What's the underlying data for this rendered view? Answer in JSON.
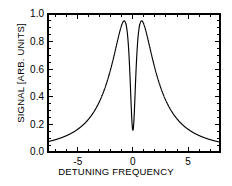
{
  "chart_data": {
    "type": "line",
    "title": "",
    "xlabel": "DETUNING FREQUENCY",
    "ylabel": "SIGNAL [ARB. UNITS]",
    "xlim": [
      -7.7,
      7.9
    ],
    "ylim": [
      0.0,
      1.0
    ],
    "grid": false,
    "legend": null,
    "x_ticks_major": [
      -5,
      0,
      5
    ],
    "x_tick_labels": [
      "-5",
      "0",
      "5"
    ],
    "x_tick_minor_step": 1,
    "y_ticks_major": [
      0.0,
      0.2,
      0.4,
      0.6,
      0.8,
      1.0
    ],
    "y_tick_labels": [
      "0.0",
      "0.2",
      "0.4",
      "0.6",
      "0.8",
      "1.0"
    ],
    "y_tick_minor_step": 0.05,
    "line_color": "#000000",
    "frame_color": "#000000",
    "peaks": [
      {
        "x": -0.55,
        "y": 0.95
      },
      {
        "x": 0.55,
        "y": 0.95
      }
    ],
    "dip": {
      "x": 0.0,
      "y": 0.12
    },
    "broad_lorentzian_hwhm": 1.9,
    "narrow_dip_hwhm": 0.36,
    "x": [
      -7.7,
      -7.4,
      -7.1,
      -6.8,
      -6.5,
      -6.2,
      -5.9,
      -5.6,
      -5.3,
      -5.0,
      -4.7,
      -4.4,
      -4.1,
      -3.8,
      -3.5,
      -3.2,
      -2.9,
      -2.6,
      -2.3,
      -2.0,
      -1.8,
      -1.6,
      -1.4,
      -1.2,
      -1.0,
      -0.9,
      -0.8,
      -0.7,
      -0.6,
      -0.55,
      -0.5,
      -0.4,
      -0.3,
      -0.2,
      -0.1,
      0.0,
      0.1,
      0.2,
      0.3,
      0.4,
      0.5,
      0.55,
      0.6,
      0.7,
      0.8,
      0.9,
      1.0,
      1.2,
      1.4,
      1.6,
      1.8,
      2.0,
      2.3,
      2.6,
      2.9,
      3.2,
      3.5,
      3.8,
      4.1,
      4.4,
      4.7,
      5.0,
      5.3,
      5.6,
      5.9,
      6.2,
      6.5,
      6.8,
      7.1,
      7.4,
      7.9
    ],
    "y": [
      0.023,
      0.025,
      0.027,
      0.029,
      0.032,
      0.035,
      0.038,
      0.042,
      0.047,
      0.052,
      0.058,
      0.066,
      0.075,
      0.086,
      0.1,
      0.117,
      0.138,
      0.165,
      0.2,
      0.245,
      0.285,
      0.333,
      0.39,
      0.458,
      0.535,
      0.576,
      0.618,
      0.66,
      0.7,
      0.95,
      0.93,
      0.62,
      0.33,
      0.18,
      0.13,
      0.12,
      0.13,
      0.18,
      0.33,
      0.62,
      0.93,
      0.95,
      0.7,
      0.66,
      0.618,
      0.576,
      0.535,
      0.458,
      0.39,
      0.333,
      0.285,
      0.245,
      0.2,
      0.165,
      0.138,
      0.117,
      0.1,
      0.086,
      0.075,
      0.066,
      0.058,
      0.052,
      0.047,
      0.042,
      0.038,
      0.035,
      0.032,
      0.029,
      0.027,
      0.025,
      0.022
    ]
  }
}
